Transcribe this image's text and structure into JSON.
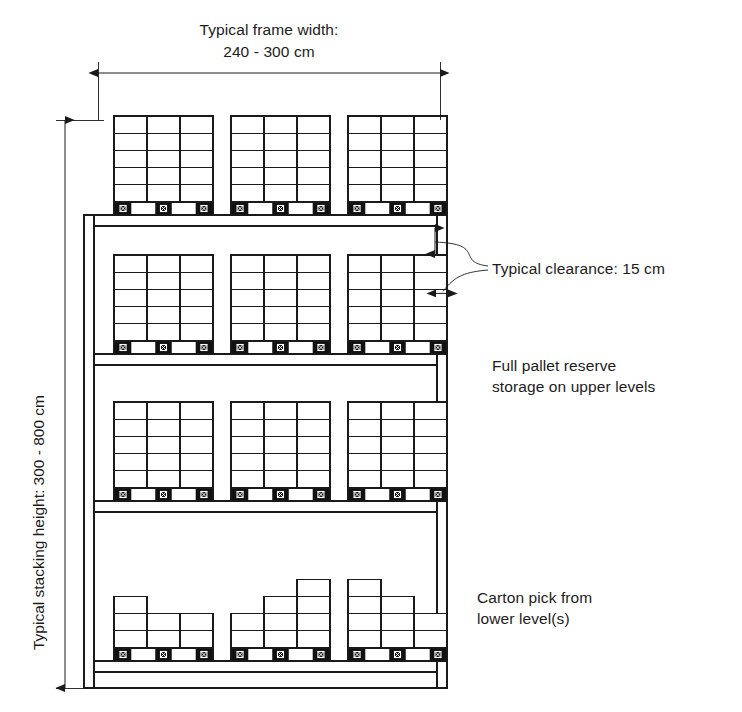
{
  "diagram": {
    "type": "warehouse-rack-elevation",
    "colors": {
      "line": "#1a1a1a",
      "pallet_block": "#111111",
      "background": "#ffffff"
    }
  },
  "dimensions": {
    "frame_width": {
      "label_line1": "Typical frame width:",
      "label_line2": "240 - 300 cm",
      "min_cm": 240,
      "max_cm": 300
    },
    "stacking_height": {
      "label": "Typical stacking height: 300 - 800 cm",
      "min_cm": 300,
      "max_cm": 800
    }
  },
  "annotations": [
    {
      "id": "clearance",
      "text": "Typical clearance: 15 cm",
      "value_cm": 15
    },
    {
      "id": "reserve",
      "line1": "Full pallet reserve",
      "line2": "storage on upper levels"
    },
    {
      "id": "pick",
      "line1": "Carton pick from",
      "line2": "lower level(s)"
    }
  ],
  "rack": {
    "levels": [
      {
        "id": "top-of-rack",
        "kind": "full-pallets",
        "inside_frame": false,
        "pallet_count": 3,
        "loads": [
          {
            "columns": [
              5,
              5,
              5
            ]
          },
          {
            "columns": [
              5,
              5,
              5
            ]
          },
          {
            "columns": [
              5,
              5,
              5
            ]
          }
        ]
      },
      {
        "id": "reserve-upper",
        "kind": "full-pallets",
        "inside_frame": true,
        "pallet_count": 3,
        "loads": [
          {
            "columns": [
              5,
              5,
              5
            ]
          },
          {
            "columns": [
              5,
              5,
              5
            ]
          },
          {
            "columns": [
              5,
              5,
              5
            ]
          }
        ]
      },
      {
        "id": "reserve-middle",
        "kind": "full-pallets",
        "inside_frame": true,
        "pallet_count": 3,
        "loads": [
          {
            "columns": [
              5,
              5,
              5
            ]
          },
          {
            "columns": [
              5,
              5,
              5
            ]
          },
          {
            "columns": [
              5,
              5,
              5
            ]
          }
        ]
      },
      {
        "id": "carton-pick",
        "kind": "partial-pallets",
        "inside_frame": true,
        "pallet_count": 3,
        "loads": [
          {
            "columns": [
              3,
              2,
              2
            ]
          },
          {
            "columns": [
              2,
              3,
              4
            ]
          },
          {
            "columns": [
              4,
              3,
              2
            ]
          }
        ]
      }
    ]
  }
}
